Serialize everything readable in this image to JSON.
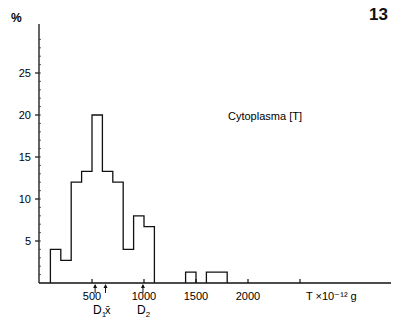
{
  "figure_number": "13",
  "chart_data": {
    "type": "bar",
    "subtype": "histogram",
    "title": "",
    "annotation": "Cytoplasma [T]",
    "xlabel": "T ×10⁻¹² g",
    "ylabel": "%",
    "xlim": [
      0,
      3500
    ],
    "ylim": [
      0,
      30
    ],
    "x_ticks": [
      500,
      1000,
      1500,
      2000
    ],
    "x_tick_labels": [
      "500",
      "1000",
      "1500",
      "2000"
    ],
    "y_ticks": [
      5,
      10,
      15,
      20,
      25
    ],
    "y_tick_labels": [
      "5",
      "10",
      "15",
      "20",
      "25"
    ],
    "y_minor_tick_step": 1,
    "grid": false,
    "bins": [
      {
        "from": 100,
        "to": 200,
        "value": 4.0
      },
      {
        "from": 200,
        "to": 300,
        "value": 2.7
      },
      {
        "from": 300,
        "to": 400,
        "value": 12.0
      },
      {
        "from": 400,
        "to": 500,
        "value": 13.3
      },
      {
        "from": 500,
        "to": 600,
        "value": 20.0
      },
      {
        "from": 600,
        "to": 700,
        "value": 13.3
      },
      {
        "from": 700,
        "to": 800,
        "value": 12.0
      },
      {
        "from": 800,
        "to": 900,
        "value": 4.0
      },
      {
        "from": 900,
        "to": 1000,
        "value": 8.0
      },
      {
        "from": 1000,
        "to": 1100,
        "value": 6.7
      },
      {
        "from": 1400,
        "to": 1500,
        "value": 1.3
      },
      {
        "from": 1600,
        "to": 1800,
        "value": 1.3
      }
    ],
    "markers": [
      {
        "label": "D1",
        "sub": "1",
        "x": 530
      },
      {
        "label": "x̄",
        "sub": "",
        "x": 630
      },
      {
        "label": "D2",
        "sub": "2",
        "x": 990
      }
    ]
  }
}
